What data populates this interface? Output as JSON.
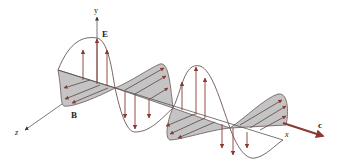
{
  "figure": {
    "type": "electromagnetic-wave",
    "labels": {
      "y_axis": "y",
      "x_axis": "x",
      "z_axis": "z",
      "electric_field": "E",
      "magnetic_field": "B",
      "propagation": "c"
    },
    "colors": {
      "arrow": "#8b3a32",
      "wave_line": "#6b5555",
      "fill": "#c4c4c4",
      "axis": "#555555"
    }
  }
}
